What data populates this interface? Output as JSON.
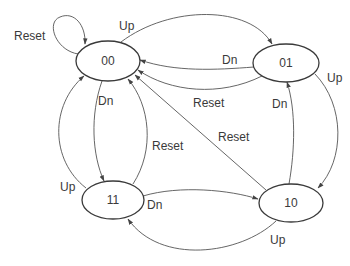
{
  "diagram": {
    "type": "state-machine",
    "colors": {
      "stroke": "#3a3a3a",
      "text": "#3a3a3a",
      "background": "#ffffff"
    },
    "states": [
      {
        "id": "s00",
        "label": "00"
      },
      {
        "id": "s01",
        "label": "01"
      },
      {
        "id": "s11",
        "label": "11"
      },
      {
        "id": "s10",
        "label": "10"
      }
    ],
    "transitions": [
      {
        "from": "00",
        "to": "00",
        "label": "Reset"
      },
      {
        "from": "00",
        "to": "01",
        "label": "Up"
      },
      {
        "from": "01",
        "to": "00",
        "label": "Dn"
      },
      {
        "from": "01",
        "to": "00",
        "label": "Reset"
      },
      {
        "from": "01",
        "to": "10",
        "label": "Up"
      },
      {
        "from": "10",
        "to": "01",
        "label": "Dn"
      },
      {
        "from": "10",
        "to": "00",
        "label": "Reset"
      },
      {
        "from": "10",
        "to": "11",
        "label": "Up"
      },
      {
        "from": "11",
        "to": "10",
        "label": "Dn"
      },
      {
        "from": "11",
        "to": "00",
        "label": "Up"
      },
      {
        "from": "00",
        "to": "11",
        "label": "Dn"
      },
      {
        "from": "11",
        "to": "00",
        "label": "Reset"
      }
    ]
  }
}
